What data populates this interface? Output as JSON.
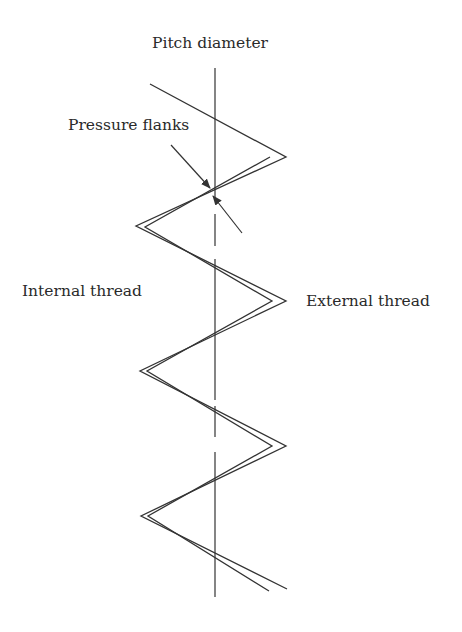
{
  "diagram": {
    "type": "thread-flank-contact",
    "labels": {
      "pitch_diameter": "Pitch diameter",
      "pressure_flanks": "Pressure flanks",
      "internal_thread": "Internal thread",
      "external_thread": "External thread"
    },
    "colors": {
      "line": "#333333",
      "text": "#2a2a2a",
      "background": "#ffffff"
    },
    "pitch_line": {
      "x": 215,
      "segments": [
        [
          68,
          200
        ],
        [
          214,
          246
        ],
        [
          259,
          400
        ],
        [
          406,
          437
        ],
        [
          452,
          597
        ]
      ]
    },
    "external_thread_profile": [
      [
        150,
        84
      ],
      [
        286,
        157
      ],
      [
        136,
        226
      ],
      [
        286,
        301
      ],
      [
        140,
        371
      ],
      [
        286,
        446
      ],
      [
        141,
        516
      ],
      [
        287,
        589
      ]
    ],
    "internal_thread_profile": [
      [
        270,
        157
      ],
      [
        145,
        227
      ],
      [
        272,
        301
      ],
      [
        147,
        371
      ],
      [
        272,
        446
      ],
      [
        148,
        516
      ],
      [
        269,
        591
      ]
    ],
    "arrows": [
      {
        "from": [
          171,
          145
        ],
        "to": [
          210,
          188
        ]
      },
      {
        "from": [
          242,
          233
        ],
        "to": [
          213,
          196
        ]
      }
    ]
  }
}
